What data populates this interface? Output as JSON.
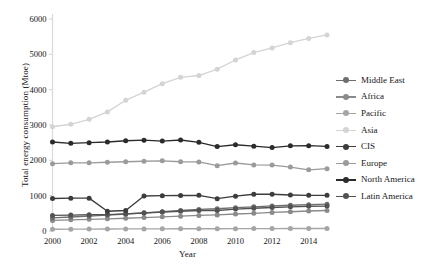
{
  "chart_data": {
    "type": "line",
    "title": "",
    "xlabel": "Year",
    "ylabel": "Total energy consumption (Mtoe)",
    "xlim": [
      2000,
      2015
    ],
    "ylim": [
      0,
      6000
    ],
    "ytick_labels": [
      "0",
      "1000",
      "2000",
      "3000",
      "4000",
      "5000",
      "6000"
    ],
    "yticks": [
      0,
      1000,
      2000,
      3000,
      4000,
      5000,
      6000
    ],
    "xtick_labels": [
      "2000",
      "2002",
      "2004",
      "2006",
      "2008",
      "2010",
      "2012",
      "2014"
    ],
    "xticks": [
      2000,
      2002,
      2004,
      2006,
      2008,
      2010,
      2012,
      2014
    ],
    "grid": false,
    "legend_position": "right",
    "markers": "circle",
    "x": [
      2000,
      2001,
      2002,
      2003,
      2004,
      2005,
      2006,
      2007,
      2008,
      2009,
      2010,
      2011,
      2012,
      2013,
      2014,
      2015
    ],
    "series": [
      {
        "name": "Middle East",
        "color": "#6e6e6e",
        "values": [
          370,
          395,
          420,
          450,
          480,
          515,
          545,
          580,
          610,
          630,
          660,
          685,
          710,
          730,
          745,
          760
        ]
      },
      {
        "name": "Africa",
        "color": "#8a8a8a",
        "values": [
          300,
          315,
          330,
          345,
          360,
          380,
          400,
          420,
          440,
          455,
          480,
          500,
          525,
          545,
          565,
          580
        ]
      },
      {
        "name": "Pacific",
        "color": "#a5a5a5",
        "values": [
          50,
          52,
          54,
          56,
          58,
          60,
          62,
          64,
          65,
          65,
          67,
          68,
          69,
          70,
          71,
          72
        ]
      },
      {
        "name": "Asia",
        "color": "#d4d4d4",
        "values": [
          2950,
          3020,
          3160,
          3370,
          3700,
          3930,
          4170,
          4350,
          4400,
          4580,
          4840,
          5050,
          5180,
          5330,
          5450,
          5550
        ]
      },
      {
        "name": "CIS",
        "color": "#3c3c3c",
        "values": [
          920,
          930,
          930,
          560,
          580,
          990,
          1000,
          1005,
          1010,
          915,
          985,
          1040,
          1040,
          1020,
          1010,
          1010
        ]
      },
      {
        "name": "Europe",
        "color": "#9b9b9b",
        "values": [
          1905,
          1930,
          1930,
          1945,
          1960,
          1975,
          1985,
          1960,
          1955,
          1850,
          1925,
          1870,
          1865,
          1810,
          1730,
          1765
        ]
      },
      {
        "name": "North America",
        "color": "#2b2b2b",
        "values": [
          2520,
          2480,
          2500,
          2520,
          2555,
          2570,
          2545,
          2575,
          2510,
          2390,
          2440,
          2400,
          2360,
          2410,
          2415,
          2395
        ]
      },
      {
        "name": "Latin America",
        "color": "#525252",
        "values": [
          440,
          450,
          460,
          465,
          485,
          510,
          535,
          560,
          580,
          580,
          620,
          645,
          665,
          685,
          700,
          705
        ]
      }
    ]
  },
  "legend": {
    "items": [
      {
        "label": "Middle East",
        "color": "#6e6e6e"
      },
      {
        "label": "Africa",
        "color": "#8a8a8a"
      },
      {
        "label": "Pacific",
        "color": "#a5a5a5"
      },
      {
        "label": "Asia",
        "color": "#d4d4d4"
      },
      {
        "label": "CIS",
        "color": "#3c3c3c"
      },
      {
        "label": "Europe",
        "color": "#9b9b9b"
      },
      {
        "label": "North America",
        "color": "#2b2b2b"
      },
      {
        "label": "Latin America",
        "color": "#525252"
      }
    ]
  },
  "style": {
    "axis_color": "#d9d9d9",
    "text_color": "#151515",
    "background": "#ffffff"
  }
}
